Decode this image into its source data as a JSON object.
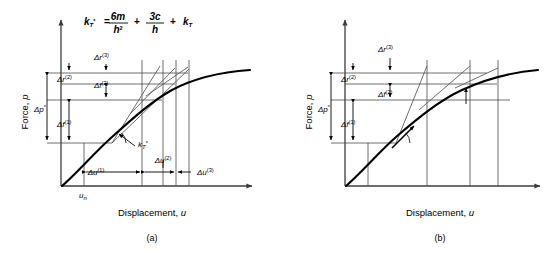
{
  "figure": {
    "equation": {
      "lhs": "k",
      "lhs_sub": "T",
      "lhs_star": "*",
      "eq_sign": "=",
      "t1_num": "6m",
      "t1_den": "h",
      "t1_den_sup": "2",
      "plus1": "+",
      "t2_num": "3c",
      "t2_den": "h",
      "plus2": "+",
      "t3": "k",
      "t3_sub": "T",
      "full_text": "k_T* = 6m/h^2 + 3c/h + k_T"
    },
    "panels": [
      {
        "id": "a",
        "caption": "(a)",
        "x_axis_title": "Displacement,",
        "x_axis_var": "u",
        "y_axis_title": "Force,",
        "y_axis_var": "p",
        "origin_label": "u",
        "origin_label_sub": "n",
        "stiffness_label": "k",
        "stiffness_sub": "T",
        "stiffness_star": "*",
        "force_labels": [
          {
            "name": "delta-p-star",
            "base": "Δp",
            "sup": "",
            "star": "*"
          },
          {
            "name": "delta-f-1",
            "base": "Δf",
            "sup": "(1)",
            "star": ""
          },
          {
            "name": "delta-f-2",
            "base": "Δf",
            "sup": "(2)",
            "star": ""
          },
          {
            "name": "delta-r-2",
            "base": "Δr",
            "sup": "(2)",
            "star": ""
          },
          {
            "name": "delta-r-3",
            "base": "Δr",
            "sup": "(3)",
            "star": ""
          }
        ],
        "disp_labels": [
          {
            "name": "delta-u-1",
            "base": "Δu",
            "sup": "(1)"
          },
          {
            "name": "delta-u-2",
            "base": "Δu",
            "sup": "(2)"
          },
          {
            "name": "delta-u-3",
            "base": "Δu",
            "sup": "(3)"
          }
        ]
      },
      {
        "id": "b",
        "caption": "(b)",
        "x_axis_title": "Displacement,",
        "x_axis_var": "u",
        "y_axis_title": "Force,",
        "y_axis_var": "p",
        "force_labels": [
          {
            "name": "delta-p-star",
            "base": "Δp",
            "sup": "",
            "star": "*"
          },
          {
            "name": "delta-f-1",
            "base": "Δf",
            "sup": "(1)",
            "star": ""
          },
          {
            "name": "delta-f-2",
            "base": "Δf",
            "sup": "(2)",
            "star": ""
          },
          {
            "name": "delta-r-2",
            "base": "Δr",
            "sup": "(2)",
            "star": ""
          },
          {
            "name": "delta-r-3",
            "base": "Δr",
            "sup": "(3)",
            "star": ""
          }
        ],
        "disp_labels": []
      }
    ],
    "colors": {
      "ink": "#000000",
      "thin_line": "#4a4a4a",
      "background": "#ffffff"
    }
  }
}
